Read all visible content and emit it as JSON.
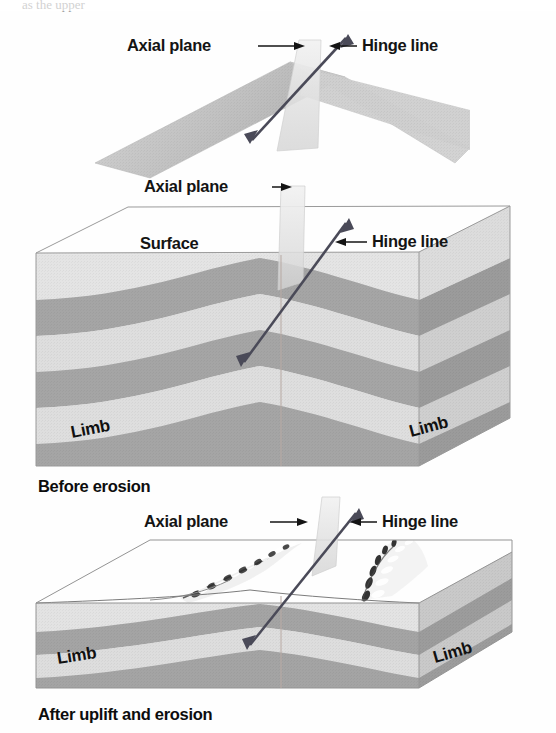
{
  "figure": {
    "cropped_top_text": "as the upper",
    "colors": {
      "page_background": "#ffffff",
      "label_text": "#141414",
      "layer_light": "#dcdcdc",
      "layer_mid": "#b4b4b4",
      "layer_dark": "#9a9a9a",
      "surface_top": "#eeeeee",
      "axial_plane": "#e2e2e2",
      "hinge_arrow": "#4a4a58",
      "block_edge": "#8d8d8d"
    }
  },
  "panels": [
    {
      "id": "panel-top",
      "caption": "",
      "labels": {
        "axial_plane": "Axial plane",
        "hinge_line": "Hinge line"
      }
    },
    {
      "id": "panel-middle",
      "caption": "Before erosion",
      "labels": {
        "axial_plane": "Axial plane",
        "hinge_line": "Hinge line",
        "surface": "Surface",
        "limb_left": "Limb",
        "limb_right": "Limb"
      }
    },
    {
      "id": "panel-bottom",
      "caption": "After uplift and erosion",
      "labels": {
        "axial_plane": "Axial plane",
        "hinge_line": "Hinge line",
        "limb_left": "Limb",
        "limb_right": "Limb"
      }
    }
  ]
}
